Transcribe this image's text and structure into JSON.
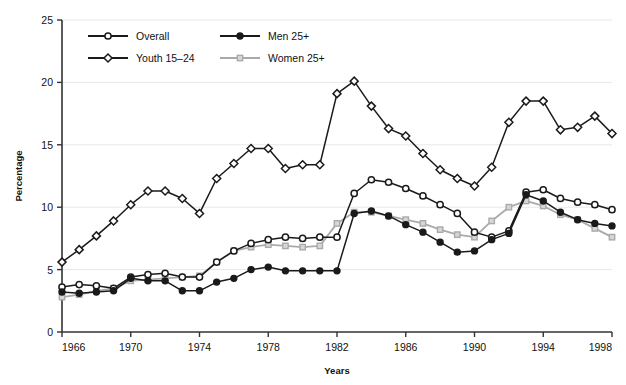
{
  "chart_data": {
    "type": "line",
    "title": "",
    "subtitle": "",
    "xlabel": "Years",
    "ylabel": "Percentage",
    "xlim": [
      1966,
      1998
    ],
    "ylim": [
      0,
      25
    ],
    "ytick_values": [
      0,
      5,
      10,
      15,
      20,
      25
    ],
    "ytick_labels": [
      "0",
      "5",
      "10",
      "15",
      "20",
      "25"
    ],
    "xtick_values": [
      1966,
      1970,
      1974,
      1978,
      1982,
      1986,
      1990,
      1994,
      1998
    ],
    "xtick_labels": [
      "1966",
      "1970",
      "1974",
      "1978",
      "1982",
      "1986",
      "1990",
      "1994",
      "1998"
    ],
    "grid": "horizontal-light",
    "legend_position": "top-left-inside",
    "x": [
      1966,
      1967,
      1968,
      1969,
      1970,
      1971,
      1972,
      1973,
      1974,
      1975,
      1976,
      1977,
      1978,
      1979,
      1980,
      1981,
      1982,
      1983,
      1984,
      1985,
      1986,
      1987,
      1988,
      1989,
      1990,
      1991,
      1992,
      1993,
      1994,
      1995,
      1996,
      1997,
      1998
    ],
    "series": [
      {
        "name": "Overall",
        "marker": "open-circle",
        "color": "#1a1a1a",
        "values": [
          3.6,
          3.8,
          3.7,
          3.5,
          4.4,
          4.6,
          4.7,
          4.4,
          4.4,
          5.6,
          6.5,
          7.1,
          7.4,
          7.6,
          7.5,
          7.6,
          7.6,
          11.1,
          12.2,
          12.0,
          11.5,
          10.9,
          10.2,
          9.5,
          8.0,
          7.6,
          8.1,
          11.2,
          11.4,
          10.7,
          10.4,
          10.2,
          9.8
        ]
      },
      {
        "name": "Youth 15–24",
        "marker": "open-diamond",
        "color": "#1a1a1a",
        "values": [
          5.6,
          6.6,
          7.7,
          8.9,
          10.2,
          11.3,
          11.3,
          10.7,
          9.5,
          12.3,
          13.5,
          14.7,
          14.7,
          13.1,
          13.4,
          13.4,
          19.1,
          20.1,
          18.1,
          16.3,
          15.7,
          14.3,
          13.0,
          12.3,
          11.7,
          13.2,
          16.8,
          18.5,
          18.5,
          16.2,
          16.4,
          17.3,
          15.9
        ]
      },
      {
        "name": "Men 25+",
        "marker": "filled-circle",
        "color": "#1a1a1a",
        "values": [
          3.2,
          3.1,
          3.2,
          3.3,
          4.3,
          4.1,
          4.1,
          3.3,
          3.3,
          4.0,
          4.3,
          5.0,
          5.2,
          4.9,
          4.9,
          4.9,
          4.9,
          9.5,
          9.7,
          9.3,
          8.6,
          8.0,
          7.2,
          6.4,
          6.5,
          7.4,
          7.9,
          11.0,
          10.5,
          9.6,
          9.0,
          8.7,
          8.5
        ]
      },
      {
        "name": "Women 25+",
        "marker": "gray-square",
        "color": "#aaaaaa",
        "values": [
          2.8,
          3.0,
          3.3,
          3.5,
          4.1,
          4.2,
          4.3,
          4.4,
          4.5,
          5.6,
          6.5,
          6.8,
          7.0,
          6.9,
          6.8,
          6.9,
          8.7,
          9.6,
          9.6,
          9.3,
          9.0,
          8.7,
          8.2,
          7.8,
          7.6,
          8.9,
          10.0,
          10.5,
          10.1,
          9.4,
          9.0,
          8.3,
          7.6
        ]
      }
    ]
  },
  "legend": {
    "items": [
      {
        "label": "Overall",
        "marker": "open-circle"
      },
      {
        "label": "Men 25+",
        "marker": "filled-circle"
      },
      {
        "label": "Youth 15–24",
        "marker": "open-diamond"
      },
      {
        "label": "Women 25+",
        "marker": "gray-square"
      }
    ]
  },
  "axis": {
    "y_title": "Percentage",
    "x_title": "Years"
  },
  "colors": {
    "line_dark": "#1a1a1a",
    "line_gray": "#aaaaaa",
    "grid": "#e8e8e8",
    "axis": "#333333",
    "background": "#ffffff"
  }
}
